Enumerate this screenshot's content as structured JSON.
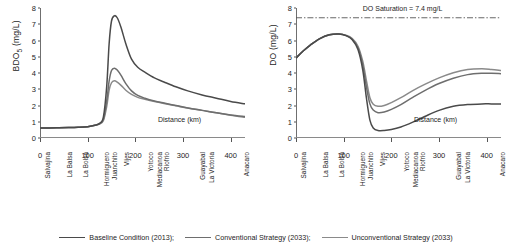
{
  "figure": {
    "legend": [
      {
        "label": "Baseline Condition (2013);",
        "color": "#4a4a4a"
      },
      {
        "label": "Conventional Strategy (2033);",
        "color": "#6e6e6e"
      },
      {
        "label": "Unconventional Strategy (2033)",
        "color": "#8a8a8a"
      }
    ]
  },
  "stations": [
    "Salvajina",
    "La Balsa",
    "La Bolsa",
    "Hormiguero",
    "Juanchito",
    "Vijes",
    "Yotoco",
    "Mediacanoa",
    "Riofrio",
    "Guayabal",
    "La Victoria",
    "Anacaro"
  ],
  "station_positions": [
    5,
    52,
    86,
    129,
    146,
    172,
    222,
    240,
    256,
    330,
    349,
    424
  ],
  "chart_data": [
    {
      "type": "line",
      "title": "",
      "xlabel": "Distance (km)",
      "ylabel": "BDO5 (mg/L)",
      "ylabel_main": "BDO",
      "ylabel_sub": "5",
      "ylabel_units": " (mg/L)",
      "xlim": [
        0,
        430
      ],
      "ylim": [
        0,
        8
      ],
      "yticks": [
        0,
        1,
        2,
        3,
        4,
        5,
        6,
        7,
        8
      ],
      "xticks": [
        0,
        100,
        200,
        300,
        400
      ],
      "grid": false,
      "legend_position": "below-figure",
      "x": [
        0,
        20,
        40,
        60,
        80,
        100,
        115,
        125,
        133,
        140,
        145,
        150,
        156,
        162,
        170,
        180,
        192,
        205,
        220,
        240,
        260,
        285,
        310,
        340,
        370,
        400,
        430
      ],
      "series": [
        {
          "name": "Baseline Condition (2013)",
          "color": "#4a4a4a",
          "values": [
            0.62,
            0.62,
            0.63,
            0.64,
            0.66,
            0.7,
            0.78,
            0.9,
            1.3,
            3.2,
            5.8,
            7.2,
            7.52,
            7.4,
            6.8,
            5.8,
            4.85,
            4.35,
            4.05,
            3.7,
            3.45,
            3.15,
            2.9,
            2.65,
            2.45,
            2.25,
            2.1
          ]
        },
        {
          "name": "Conventional Strategy (2033)",
          "color": "#6e6e6e",
          "values": [
            0.62,
            0.62,
            0.63,
            0.64,
            0.66,
            0.7,
            0.78,
            0.88,
            1.15,
            2.3,
            3.5,
            4.15,
            4.3,
            4.18,
            3.85,
            3.35,
            2.9,
            2.62,
            2.45,
            2.28,
            2.15,
            2.0,
            1.85,
            1.7,
            1.55,
            1.42,
            1.32
          ]
        },
        {
          "name": "Unconventional Strategy (2033)",
          "color": "#8a8a8a",
          "values": [
            0.62,
            0.62,
            0.63,
            0.64,
            0.66,
            0.7,
            0.78,
            0.86,
            1.08,
            1.95,
            2.95,
            3.4,
            3.52,
            3.44,
            3.24,
            2.94,
            2.68,
            2.5,
            2.38,
            2.24,
            2.12,
            1.98,
            1.84,
            1.7,
            1.55,
            1.4,
            1.28
          ]
        }
      ]
    },
    {
      "type": "line",
      "title": "",
      "xlabel": "Distance (km)",
      "ylabel": "DO (mg/L)",
      "ylabel_main": "DO (mg/L)",
      "xlim": [
        0,
        430
      ],
      "ylim": [
        0,
        8
      ],
      "yticks": [
        0,
        1,
        2,
        3,
        4,
        5,
        6,
        7,
        8
      ],
      "xticks": [
        0,
        100,
        200,
        300,
        400
      ],
      "grid": false,
      "legend_position": "below-figure",
      "annotation": {
        "text": "DO Saturation = 7.4 mg/L",
        "value": 7.4,
        "style": "dash-dot",
        "color": "#555555"
      },
      "x": [
        0,
        15,
        30,
        50,
        70,
        90,
        105,
        118,
        130,
        140,
        148,
        155,
        162,
        172,
        185,
        200,
        220,
        245,
        270,
        300,
        330,
        360,
        390,
        410,
        430
      ],
      "series": [
        {
          "name": "Baseline Condition (2013)",
          "color": "#4a4a4a",
          "values": [
            4.92,
            5.35,
            5.72,
            6.12,
            6.35,
            6.4,
            6.3,
            6.05,
            5.45,
            4.2,
            2.4,
            1.1,
            0.62,
            0.46,
            0.46,
            0.52,
            0.68,
            0.98,
            1.32,
            1.7,
            1.95,
            2.06,
            2.1,
            2.1,
            2.1
          ]
        },
        {
          "name": "Conventional Strategy (2033)",
          "color": "#6e6e6e",
          "values": [
            4.92,
            5.35,
            5.72,
            6.12,
            6.35,
            6.4,
            6.3,
            6.08,
            5.55,
            4.5,
            3.1,
            2.1,
            1.72,
            1.56,
            1.6,
            1.76,
            2.05,
            2.5,
            2.92,
            3.35,
            3.68,
            3.9,
            3.98,
            3.98,
            3.96
          ]
        },
        {
          "name": "Unconventional Strategy (2033)",
          "color": "#8a8a8a",
          "values": [
            4.92,
            5.35,
            5.72,
            6.12,
            6.35,
            6.4,
            6.32,
            6.12,
            5.65,
            4.72,
            3.48,
            2.48,
            2.08,
            1.95,
            2.0,
            2.18,
            2.48,
            2.92,
            3.3,
            3.7,
            4.02,
            4.22,
            4.26,
            4.22,
            4.16
          ]
        }
      ]
    }
  ]
}
